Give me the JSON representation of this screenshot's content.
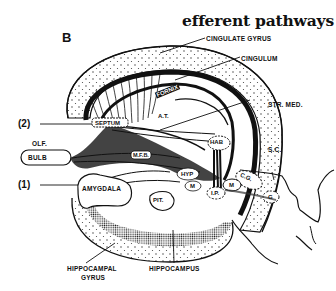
{
  "title": "efferent pathways",
  "panel_label": "B",
  "labels": {
    "cingulate_gyrus": "CINGULATE GYRUS",
    "cingulum": "CINGULUM",
    "fornix": "FORNIX",
    "at": "A.T.",
    "str_med": "STR. MED.",
    "septum": "SEPTUM",
    "hab": "HAB",
    "olf": "OLF.",
    "bulb": "BULB",
    "mfb": "M.F.B.",
    "sc": "S.C.",
    "amygdala": "AMYGDALA",
    "hyp": "HYP",
    "m_body": "M",
    "m_mid": "M",
    "cg": "C.G.",
    "ip": "I.P.",
    "g": "G",
    "pit": "PIT.",
    "hippocampal_gyrus_1": "HIPPOCAMPAL",
    "hippocampal_gyrus_2": "GYRUS",
    "hippocampus": "HIPPOCAMPUS"
  },
  "markers": {
    "two": "(2)",
    "one": "(1)"
  }
}
